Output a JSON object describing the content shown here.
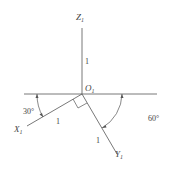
{
  "diagram": {
    "axes": {
      "z": {
        "label": "Z",
        "subscript": "1",
        "length_label": "1"
      },
      "x": {
        "label": "X",
        "subscript": "1",
        "length_label": "1"
      },
      "y": {
        "label": "Y",
        "subscript": "1",
        "length_label": "1"
      }
    },
    "origin": {
      "label": "O",
      "subscript": "1"
    },
    "angles": {
      "x_angle": "30°",
      "y_angle": "60°"
    },
    "colors": {
      "line": "#555555",
      "text": "#444444"
    }
  }
}
